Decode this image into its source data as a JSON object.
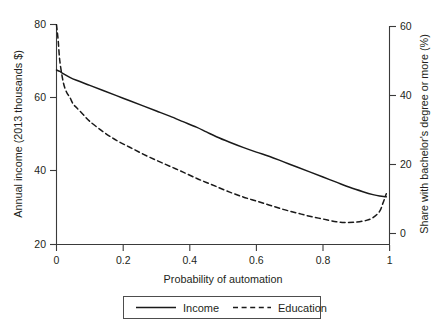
{
  "chart_data": {
    "type": "line",
    "title": "",
    "subtitle": "",
    "xlabel": "Probability of automation",
    "ylabel": "Annual income (2013 thousands $)",
    "y2label": "Share with bachelor's degree or more (%)",
    "xlim": [
      0,
      1
    ],
    "ylim": [
      20,
      80
    ],
    "y2lim": [
      0,
      60
    ],
    "xticks": [
      "0",
      "0.2",
      "0.4",
      "0.6",
      "0.8",
      "1"
    ],
    "xtick_values": [
      0,
      0.2,
      0.4,
      0.6,
      0.8,
      1
    ],
    "yticks": [
      "20",
      "40",
      "60",
      "80"
    ],
    "ytick_values": [
      20,
      40,
      60,
      80
    ],
    "y2ticks": [
      "0",
      "20",
      "40",
      "60"
    ],
    "y2tick_values": [
      0,
      20,
      40,
      60
    ],
    "grid": false,
    "legend_position": "bottom-center",
    "series": [
      {
        "name": "Income",
        "axis": "left",
        "style": "solid",
        "color": "#1a1a1a",
        "x": [
          0.0,
          0.01,
          0.02,
          0.04,
          0.06,
          0.1,
          0.14,
          0.18,
          0.22,
          0.26,
          0.3,
          0.34,
          0.38,
          0.42,
          0.45,
          0.48,
          0.52,
          0.56,
          0.6,
          0.64,
          0.68,
          0.72,
          0.76,
          0.8,
          0.84,
          0.88,
          0.92,
          0.95,
          0.97,
          0.99
        ],
        "y": [
          67.6,
          67.2,
          66.6,
          65.6,
          64.8,
          63.4,
          62.0,
          60.6,
          59.2,
          57.8,
          56.4,
          55.0,
          53.5,
          52.0,
          50.7,
          49.4,
          47.9,
          46.5,
          45.2,
          44.0,
          42.6,
          41.2,
          39.8,
          38.4,
          37.0,
          35.6,
          34.4,
          33.6,
          33.2,
          33.0
        ]
      },
      {
        "name": "Education",
        "axis": "right",
        "style": "dashed",
        "color": "#1a1a1a",
        "x": [
          0.0,
          0.005,
          0.01,
          0.02,
          0.03,
          0.04,
          0.05,
          0.06,
          0.08,
          0.1,
          0.14,
          0.18,
          0.22,
          0.26,
          0.3,
          0.34,
          0.38,
          0.42,
          0.45,
          0.48,
          0.52,
          0.56,
          0.6,
          0.64,
          0.68,
          0.72,
          0.76,
          0.8,
          0.84,
          0.87,
          0.9,
          0.93,
          0.95,
          0.97,
          0.98,
          0.99
        ],
        "y": [
          60.5,
          56.0,
          50.0,
          44.0,
          41.0,
          39.5,
          37.5,
          36.5,
          34.5,
          32.5,
          29.5,
          27.0,
          25.0,
          23.0,
          21.2,
          19.5,
          17.8,
          16.0,
          14.8,
          13.6,
          12.0,
          10.6,
          9.4,
          8.2,
          7.0,
          6.0,
          5.0,
          4.2,
          3.4,
          3.2,
          3.3,
          3.8,
          4.6,
          6.4,
          8.8,
          11.5
        ]
      }
    ],
    "annotations": [],
    "notes": {
      "income_left_axis_start": 67.6,
      "income_left_axis_end": 33.0,
      "education_right_axis_start": 60.5,
      "education_right_axis_min": 3.2,
      "education_right_axis_end": 11.5
    }
  },
  "legend": {
    "items": [
      {
        "label": "Income",
        "style": "solid"
      },
      {
        "label": "Education",
        "style": "dashed"
      }
    ]
  },
  "colors": {
    "line": "#1a1a1a",
    "axis": "#3a3a3a",
    "text": "#231f20",
    "background": "#ffffff",
    "legend_border": "#4d4d4d"
  }
}
